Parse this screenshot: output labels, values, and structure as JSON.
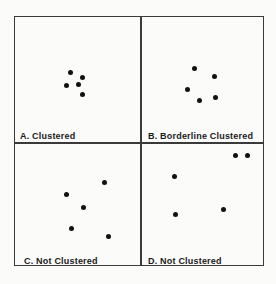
{
  "panels": [
    {
      "label": "A. Clustered",
      "points": [
        [
          70,
          72
        ],
        [
          82,
          77
        ],
        [
          66,
          85
        ],
        [
          78,
          84
        ],
        [
          82,
          94
        ]
      ]
    },
    {
      "label": "B. Borderline Clustered",
      "points": [
        [
          194,
          68
        ],
        [
          214,
          76
        ],
        [
          187,
          89
        ],
        [
          199,
          100
        ],
        [
          215,
          97
        ]
      ]
    },
    {
      "label": "C. Not Clustered",
      "points": [
        [
          104,
          182
        ],
        [
          66,
          194
        ],
        [
          83,
          207
        ],
        [
          71,
          228
        ],
        [
          108,
          236
        ]
      ]
    },
    {
      "label": "D. Not Clustered",
      "points": [
        [
          235,
          155
        ],
        [
          247,
          155
        ],
        [
          174,
          176
        ],
        [
          223,
          209
        ],
        [
          175,
          214
        ]
      ]
    }
  ]
}
